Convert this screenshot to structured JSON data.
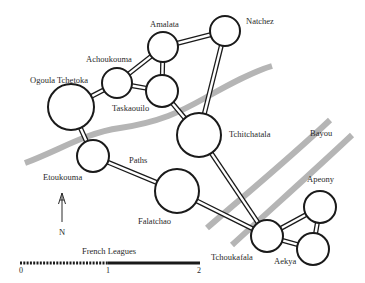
{
  "colors": {
    "river": "#b5b5b5",
    "node_stroke": "#1a1a1a",
    "background": "#ffffff",
    "text": "#2a2a2a"
  },
  "nodes": [
    {
      "id": "ogoula-tchetoka",
      "label": "Ogoula Tchetoka",
      "cx": 71,
      "cy": 107,
      "r": 23,
      "lx": 30,
      "ly": 83
    },
    {
      "id": "achoukouma",
      "label": "Achoukouma",
      "cx": 117,
      "cy": 83,
      "r": 15,
      "lx": 86,
      "ly": 62
    },
    {
      "id": "amalata",
      "label": "Amalata",
      "cx": 163,
      "cy": 47,
      "r": 15,
      "lx": 150,
      "ly": 27
    },
    {
      "id": "natchez",
      "label": "Natchez",
      "cx": 225,
      "cy": 31,
      "r": 15,
      "lx": 246,
      "ly": 24
    },
    {
      "id": "taskaouilo",
      "label": "Taskaouilo",
      "cx": 162,
      "cy": 91,
      "r": 16,
      "lx": 112,
      "ly": 111
    },
    {
      "id": "tchitchatala",
      "label": "Tchitchatala",
      "cx": 199,
      "cy": 135,
      "r": 22,
      "lx": 229,
      "ly": 137
    },
    {
      "id": "etoukouma",
      "label": "Etoukouma",
      "cx": 93,
      "cy": 156,
      "r": 16,
      "lx": 43,
      "ly": 180
    },
    {
      "id": "falatchao",
      "label": "Falatchao",
      "cx": 177,
      "cy": 191,
      "r": 22,
      "lx": 138,
      "ly": 224
    },
    {
      "id": "tchoukafala",
      "label": "Tchoukafala",
      "cx": 267,
      "cy": 236,
      "r": 16,
      "lx": 211,
      "ly": 260
    },
    {
      "id": "apeony",
      "label": "Apeony",
      "cx": 320,
      "cy": 207,
      "r": 16,
      "lx": 307,
      "ly": 182
    },
    {
      "id": "aekya",
      "label": "Aekya",
      "cx": 313,
      "cy": 249,
      "r": 16,
      "lx": 274,
      "ly": 264
    }
  ],
  "edges": [
    [
      "ogoula-tchetoka",
      "achoukouma"
    ],
    [
      "achoukouma",
      "amalata"
    ],
    [
      "achoukouma",
      "taskaouilo"
    ],
    [
      "amalata",
      "taskaouilo"
    ],
    [
      "amalata",
      "natchez"
    ],
    [
      "natchez",
      "tchitchatala"
    ],
    [
      "taskaouilo",
      "tchitchatala"
    ],
    [
      "ogoula-tchetoka",
      "etoukouma"
    ],
    [
      "etoukouma",
      "falatchao"
    ],
    [
      "falatchao",
      "tchoukafala"
    ],
    [
      "tchitchatala",
      "tchoukafala"
    ],
    [
      "tchoukafala",
      "apeony"
    ],
    [
      "tchoukafala",
      "aekya"
    ],
    [
      "apeony",
      "aekya"
    ]
  ],
  "rivers": [
    {
      "name": "main-river",
      "d": "M 25 163 C 60 150, 85 133, 120 128 C 160 122, 180 112, 205 98 C 230 84, 252 72, 272 66"
    },
    {
      "name": "bayou-west",
      "d": "M 207 228 C 245 195, 290 158, 330 120"
    },
    {
      "name": "bayou-east",
      "d": "M 232 245 C 270 210, 315 170, 352 135"
    }
  ],
  "annotations": {
    "paths_label": "Paths",
    "paths_x": 129,
    "paths_y": 163,
    "bayou_label": "Bayou",
    "bayou_x": 310,
    "bayou_y": 136
  },
  "compass": {
    "label": "N",
    "x": 62,
    "top": 193,
    "bottom": 222,
    "label_y": 235
  },
  "scale": {
    "title": "French Leagues",
    "title_x": 82,
    "title_y": 254,
    "y": 263,
    "start_x": 20,
    "mid_x": 108,
    "end_x": 200,
    "ticks": [
      {
        "label": "0",
        "x": 21
      },
      {
        "label": "1",
        "x": 108
      },
      {
        "label": "2",
        "x": 199
      }
    ],
    "tick_label_y": 273
  }
}
